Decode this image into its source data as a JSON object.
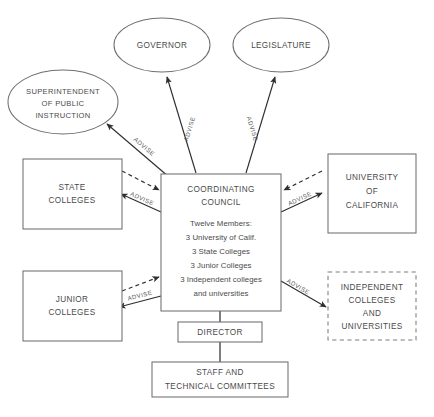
{
  "diagram": {
    "background_color": "#ffffff",
    "shape_stroke_color": "#6f6f6f",
    "arrow_color": "#2e2e2e",
    "text_color": "#4a4a4a",
    "nodes": {
      "governor": {
        "label": "GOVERNOR",
        "shape": "ellipse"
      },
      "legislature": {
        "label": "LEGISLATURE",
        "shape": "ellipse"
      },
      "superintendent": {
        "shape": "ellipse",
        "line1": "SUPERINTENDENT",
        "line2": "OF PUBLIC",
        "line3": "INSTRUCTION"
      },
      "state_colleges": {
        "shape": "rect",
        "line1": "STATE",
        "line2": "COLLEGES"
      },
      "junior_colleges": {
        "shape": "rect",
        "line1": "JUNIOR",
        "line2": "COLLEGES"
      },
      "university_of_california": {
        "shape": "rect",
        "line1": "UNIVERSITY",
        "line2": "OF",
        "line3": "CALIFORNIA"
      },
      "independent_colleges": {
        "shape": "rect-dashed",
        "line1": "INDEPENDENT",
        "line2": "COLLEGES",
        "line3": "AND",
        "line4": "UNIVERSITIES"
      },
      "coordinating_council": {
        "shape": "rect",
        "title1": "COORDINATING",
        "title2": "COUNCIL",
        "body1": "Twelve Members:",
        "body2": "3 University of Calif.",
        "body3": "3 State Colleges",
        "body4": "3 Junior Colleges",
        "body5": "3 Independent colleges",
        "body6": "and universities"
      },
      "director": {
        "shape": "rect",
        "label": "DIRECTOR"
      },
      "staff": {
        "shape": "rect",
        "line1": "STAFF AND",
        "line2": "TECHNICAL COMMITTEES"
      }
    },
    "edges": [
      {
        "id": "council-to-governor",
        "from": "coordinating_council",
        "to": "governor",
        "label": "ADVISE",
        "style": "solid",
        "arrow": "single"
      },
      {
        "id": "council-to-legislature",
        "from": "coordinating_council",
        "to": "legislature",
        "label": "ADVISE",
        "style": "solid",
        "arrow": "single"
      },
      {
        "id": "council-to-superintendent",
        "from": "coordinating_council",
        "to": "superintendent",
        "label": "ADVISE",
        "style": "solid",
        "arrow": "single"
      },
      {
        "id": "council-to-state-colleges",
        "from": "coordinating_council",
        "to": "state_colleges",
        "label": "ADVISE",
        "style": "solid",
        "arrow": "single"
      },
      {
        "id": "state-colleges-to-council",
        "from": "state_colleges",
        "to": "coordinating_council",
        "label": "",
        "style": "dashed",
        "arrow": "single"
      },
      {
        "id": "council-to-junior-colleges",
        "from": "coordinating_council",
        "to": "junior_colleges",
        "label": "ADVISE",
        "style": "solid",
        "arrow": "single"
      },
      {
        "id": "junior-colleges-to-council",
        "from": "junior_colleges",
        "to": "coordinating_council",
        "label": "",
        "style": "dashed",
        "arrow": "single"
      },
      {
        "id": "council-to-university-of-california",
        "from": "coordinating_council",
        "to": "university_of_california",
        "label": "ADVISE",
        "style": "solid",
        "arrow": "single"
      },
      {
        "id": "university-of-california-to-council",
        "from": "university_of_california",
        "to": "coordinating_council",
        "label": "",
        "style": "dashed",
        "arrow": "single"
      },
      {
        "id": "council-to-independent-colleges",
        "from": "coordinating_council",
        "to": "independent_colleges",
        "label": "ADVISE",
        "style": "solid",
        "arrow": "single"
      },
      {
        "id": "council-to-director",
        "from": "coordinating_council",
        "to": "director",
        "label": "",
        "style": "plain",
        "arrow": "none"
      },
      {
        "id": "director-to-staff",
        "from": "director",
        "to": "staff",
        "label": "",
        "style": "plain",
        "arrow": "none"
      }
    ],
    "caption": ""
  }
}
